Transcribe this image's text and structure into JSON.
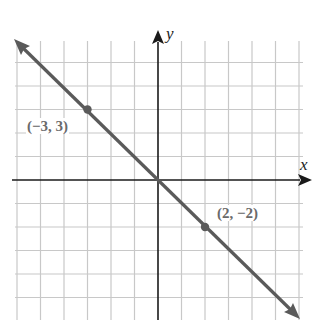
{
  "chart_data": {
    "type": "line",
    "title": "",
    "xlabel": "x",
    "ylabel": "y",
    "xlim": [
      -6,
      6
    ],
    "ylim": [
      -6,
      6
    ],
    "grid": true,
    "legend": null,
    "series": [
      {
        "name": "y = -x",
        "x": [
          -6,
          6
        ],
        "y": [
          6,
          -6
        ],
        "color": "#5a5a5a",
        "arrows": "both"
      }
    ],
    "points": [
      {
        "x": -3,
        "y": 3,
        "label": "(−3, 3)"
      },
      {
        "x": 2,
        "y": -2,
        "label": "(2, −2)"
      }
    ],
    "annotations": [
      "(−3, 3)",
      "(2, −2)"
    ]
  },
  "labels": {
    "x_axis": "x",
    "y_axis": "y",
    "point_a": "(−3, 3)",
    "point_b": "(2, −2)"
  },
  "colors": {
    "grid": "#c8c8c8",
    "axis": "#1a1a1a",
    "line": "#5a5a5a",
    "label": "#6a6a6a"
  }
}
